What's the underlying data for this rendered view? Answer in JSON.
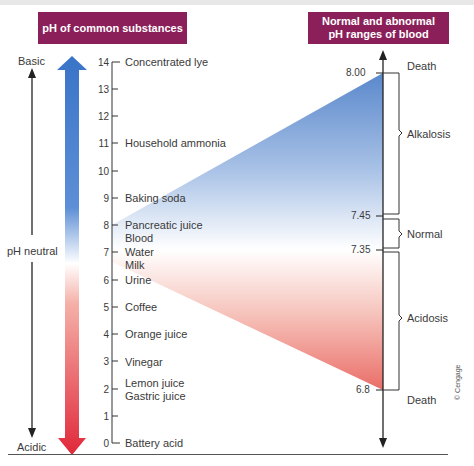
{
  "headers": {
    "left": "pH of common substances",
    "right_line1": "Normal and abnormal",
    "right_line2": "pH ranges of blood"
  },
  "side_labels": {
    "top": "Basic",
    "middle": "pH neutral",
    "bottom": "Acidic"
  },
  "scale": {
    "ticks": [
      "0",
      "1",
      "2",
      "3",
      "4",
      "5",
      "6",
      "7",
      "8",
      "9",
      "10",
      "11",
      "12",
      "13",
      "14"
    ]
  },
  "substances": [
    {
      "ph": 14,
      "label": "Concentrated lye"
    },
    {
      "ph": 11,
      "label": "Household ammonia"
    },
    {
      "ph": 9,
      "label": "Baking soda"
    },
    {
      "ph": 8,
      "label": "Pancreatic juice"
    },
    {
      "ph": 7.6,
      "label": "Blood"
    },
    {
      "ph": 7,
      "label": "Water"
    },
    {
      "ph": 6.6,
      "label": "Milk"
    },
    {
      "ph": 6,
      "label": "Urine"
    },
    {
      "ph": 5,
      "label": "Coffee"
    },
    {
      "ph": 4,
      "label": "Orange juice"
    },
    {
      "ph": 3,
      "label": "Vinegar"
    },
    {
      "ph": 2.3,
      "label": "Lemon juice"
    },
    {
      "ph": 1.9,
      "label": "Gastric juice"
    },
    {
      "ph": 0,
      "label": "Battery acid"
    }
  ],
  "blood": {
    "values": [
      "8.00",
      "7.45",
      "7.35",
      "6.8"
    ],
    "ranges": [
      {
        "label": "Death",
        "position": "above 8.00"
      },
      {
        "label": "Alkalosis",
        "range": "7.45–8.00"
      },
      {
        "label": "Normal",
        "range": "7.35–7.45"
      },
      {
        "label": "Acidosis",
        "range": "6.8–7.35"
      },
      {
        "label": "Death",
        "position": "below 6.8"
      }
    ]
  },
  "colors": {
    "header_bg": "#8b1f5a",
    "basic_blue": "#3a74c8",
    "acidic_red": "#e0283a"
  },
  "credit": "© Cengage"
}
